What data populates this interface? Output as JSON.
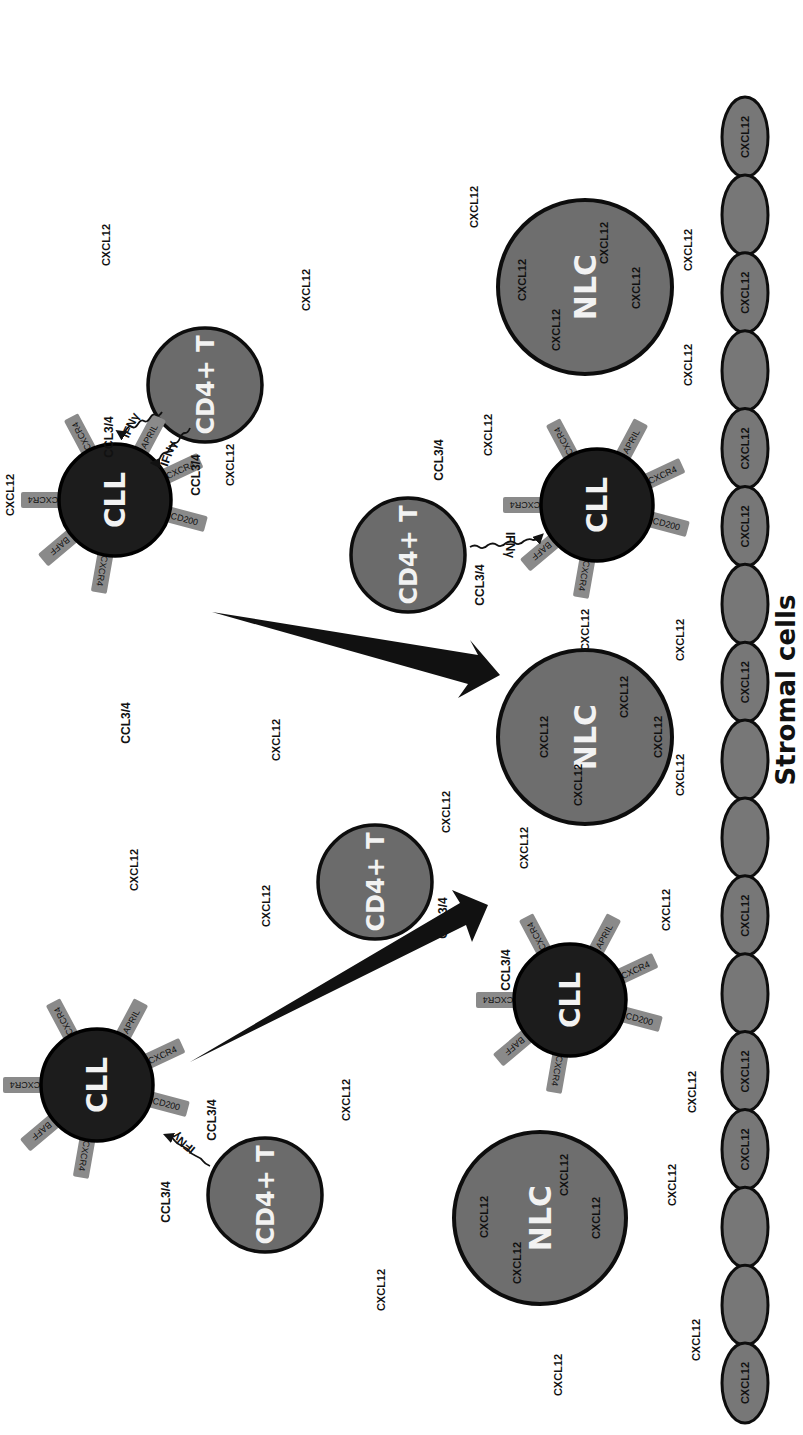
{
  "diagram": {
    "title": "Stromal cells",
    "colors": {
      "cd4_fill": "#6b6b6b",
      "cll_fill": "#1c1c1c",
      "nlc_fill": "#6e6e6e",
      "stroma_fill": "#777777",
      "receptor_fill": "#8a8a8a",
      "outline": "#0d0d0d",
      "background": "#ffffff"
    },
    "cell_types": {
      "cd4": "CD4+ T",
      "cll": "CLL",
      "nlc": "NLC"
    },
    "receptors": [
      "CXCR4",
      "APRIL",
      "CXCR4",
      "CD200",
      "CXCR4",
      "BAFF",
      "CXCR4"
    ],
    "signals": {
      "ifn": "IFNγ",
      "ccl": "CCL3/4",
      "cxcl": "CXCL12"
    },
    "cd4_cells": [
      {
        "id": "cd4-top",
        "label": "CD4+ T"
      },
      {
        "id": "cd4-mid-right",
        "label": "CD4+ T"
      },
      {
        "id": "cd4-mid",
        "label": "CD4+ T"
      },
      {
        "id": "cd4-bottom",
        "label": "CD4+ T"
      }
    ],
    "cll_cells": [
      {
        "id": "cll-top",
        "label": "CLL",
        "receptors": [
          "CXCR4",
          "APRIL",
          "CXCR4",
          "CD200",
          "CXCR4",
          "BAFF",
          "CXCR4"
        ]
      },
      {
        "id": "cll-right",
        "label": "CLL",
        "receptors": [
          "CXCR4",
          "APRIL",
          "CXCR4",
          "CD200",
          "CXCR4",
          "BAFF",
          "CXCR4"
        ]
      },
      {
        "id": "cll-mid",
        "label": "CLL",
        "receptors": [
          "CXCR4",
          "APRIL",
          "CXCR4",
          "CD200",
          "CXCR4",
          "BAFF",
          "CXCR4"
        ]
      },
      {
        "id": "cll-bottom",
        "label": "CLL",
        "receptors": [
          "CXCR4",
          "APRIL",
          "CXCR4",
          "CD200",
          "CXCR4",
          "BAFF",
          "CXCR4"
        ]
      }
    ],
    "nlc_cells": [
      {
        "id": "nlc-top",
        "label": "NLC",
        "inner": [
          "CXCL12",
          "CXCL12",
          "CXCL12",
          "CXCL12"
        ]
      },
      {
        "id": "nlc-mid",
        "label": "NLC",
        "inner": [
          "CXCL12",
          "CXCL12",
          "CXCL12",
          "CXCL12"
        ]
      },
      {
        "id": "nlc-bottom",
        "label": "NLC",
        "inner": [
          "CXCL12",
          "CXCL12",
          "CXCL12",
          "CXCL12"
        ]
      }
    ],
    "stromal_cells": {
      "count": 22,
      "labeled": "CXCL12"
    },
    "free_labels": {
      "cxcl12": "CXCL12",
      "ccl34": "CCL3/4",
      "ifng": "IFNγ"
    }
  }
}
